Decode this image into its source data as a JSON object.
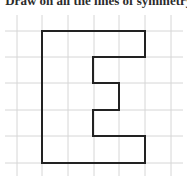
{
  "caption": "Draw on all the lines of symmetry.",
  "grid": {
    "vertical_x": [
      17,
      42,
      68,
      94,
      119,
      145,
      171
    ],
    "horizontal_y": [
      31,
      57,
      83,
      110,
      136,
      163
    ],
    "x_extent": [
      5,
      183
    ],
    "y_extent": [
      15,
      176
    ],
    "color": "#d6d6d6"
  },
  "shape": {
    "name": "letter E outline",
    "stroke": "#222222",
    "points": "42,31 145,31 145,57 93,57 93,83 119,83 119,110 93,110 93,136 145,136 145,163 42,163"
  }
}
